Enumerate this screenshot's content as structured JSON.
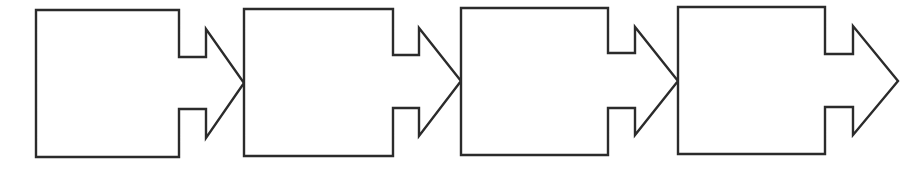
{
  "diagram": {
    "type": "process-flow",
    "background": "#ffffff",
    "stroke_color": "#2b2b2b",
    "steps": [
      {
        "label": "",
        "rect": {
          "left": 36,
          "top": 10,
          "right": 179,
          "bottom": 157
        },
        "notch": {
          "top": 57,
          "bottom": 109,
          "x": 206
        },
        "arrow": {
          "top": 29,
          "bottom": 138,
          "tip_x": 244,
          "tip_y": 83
        }
      },
      {
        "label": "",
        "rect": {
          "left": 244,
          "top": 9,
          "right": 393,
          "bottom": 156
        },
        "notch": {
          "top": 55,
          "bottom": 108,
          "x": 419
        },
        "arrow": {
          "top": 28,
          "bottom": 136,
          "tip_x": 461,
          "tip_y": 81
        }
      },
      {
        "label": "",
        "rect": {
          "left": 461,
          "top": 8,
          "right": 608,
          "bottom": 155
        },
        "notch": {
          "top": 53,
          "bottom": 108,
          "x": 635
        },
        "arrow": {
          "top": 27,
          "bottom": 135,
          "tip_x": 678,
          "tip_y": 81
        }
      },
      {
        "label": "",
        "rect": {
          "left": 678,
          "top": 7,
          "right": 825,
          "bottom": 154
        },
        "notch": {
          "top": 54,
          "bottom": 107,
          "x": 853
        },
        "arrow": {
          "top": 26,
          "bottom": 135,
          "tip_x": 898,
          "tip_y": 81
        }
      }
    ]
  }
}
